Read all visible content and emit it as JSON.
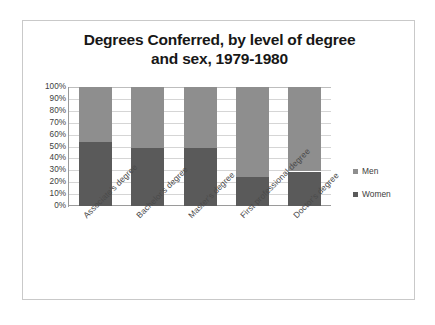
{
  "chart_data": {
    "type": "bar",
    "subtype": "stacked-100-percent",
    "title": "Degrees Conferred, by level of degree and sex, 1979-1980",
    "title_line1": "Degrees Conferred, by level of degree",
    "title_line2": "and sex, 1979-1980",
    "xlabel": "",
    "ylabel": "",
    "ylim": [
      0,
      100
    ],
    "ytick_labels": [
      "100%",
      "90%",
      "80%",
      "70%",
      "60%",
      "50%",
      "40%",
      "30%",
      "20%",
      "10%",
      "0%"
    ],
    "ytick_values": [
      100,
      90,
      80,
      70,
      60,
      50,
      40,
      30,
      20,
      10,
      0
    ],
    "grid": true,
    "legend_position": "right",
    "categories": [
      "Associate's degree",
      "Bachelor's degree",
      "Master's degree",
      "First professional degree",
      "Doctor's degree"
    ],
    "series": [
      {
        "name": "Men",
        "color": "#8e8e8e",
        "values": [
          46,
          51,
          51,
          76,
          71
        ]
      },
      {
        "name": "Women",
        "color": "#5a5a5a",
        "values": [
          54,
          49,
          49,
          24,
          29
        ]
      }
    ]
  },
  "legend": {
    "items": [
      {
        "label": "Men",
        "color": "#8e8e8e"
      },
      {
        "label": "Women",
        "color": "#5a5a5a"
      }
    ]
  }
}
